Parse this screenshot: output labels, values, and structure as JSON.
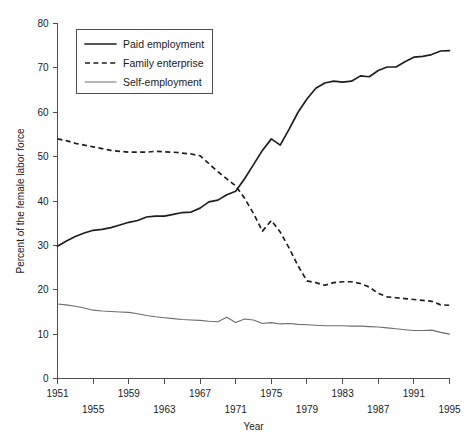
{
  "chart_data": {
    "type": "line",
    "title": "",
    "xlabel": "Year",
    "ylabel": "Percent of the female labor force",
    "xlim": [
      1951,
      1995
    ],
    "ylim": [
      0,
      80
    ],
    "ytick_values": [
      0,
      10,
      20,
      30,
      40,
      50,
      60,
      70,
      80
    ],
    "ytick_labels": [
      "0",
      "10",
      "20",
      "30",
      "40",
      "50",
      "60",
      "70",
      "80"
    ],
    "xtick_values": [
      1951,
      1955,
      1959,
      1963,
      1967,
      1971,
      1975,
      1979,
      1983,
      1987,
      1991,
      1995
    ],
    "xtick_labels": [
      "1951",
      "1955",
      "1959",
      "1963",
      "1967",
      "1971",
      "1975",
      "1979",
      "1983",
      "1987",
      "1991",
      "1995"
    ],
    "xtick_stagger": [
      0,
      1,
      0,
      1,
      0,
      1,
      0,
      1,
      0,
      1,
      0,
      1
    ],
    "grid": false,
    "legend_position": "top-left",
    "x": [
      1951,
      1952,
      1953,
      1954,
      1955,
      1956,
      1957,
      1958,
      1959,
      1960,
      1961,
      1962,
      1963,
      1964,
      1965,
      1966,
      1967,
      1968,
      1969,
      1970,
      1971,
      1972,
      1973,
      1974,
      1975,
      1976,
      1977,
      1978,
      1979,
      1980,
      1981,
      1982,
      1983,
      1984,
      1985,
      1986,
      1987,
      1988,
      1989,
      1990,
      1991,
      1992,
      1993,
      1994,
      1995
    ],
    "series": [
      {
        "name": "Paid employment",
        "style": "solid-thick",
        "color": "#1f1f1f",
        "values": [
          29.8,
          31.0,
          32.0,
          32.8,
          33.4,
          33.6,
          34.0,
          34.6,
          35.2,
          35.6,
          36.4,
          36.6,
          36.6,
          37.0,
          37.4,
          37.5,
          38.4,
          39.8,
          40.2,
          41.4,
          42.2,
          45.0,
          48.2,
          51.4,
          54.0,
          52.6,
          56.2,
          60.0,
          63.0,
          65.4,
          66.6,
          67.0,
          66.8,
          67.0,
          68.2,
          68.0,
          69.4,
          70.2,
          70.2,
          71.4,
          72.4,
          72.6,
          73.0,
          73.8,
          73.9
        ]
      },
      {
        "name": "Family enterprise",
        "style": "dashed",
        "color": "#1f1f1f",
        "values": [
          54.0,
          53.6,
          53.0,
          52.6,
          52.2,
          51.8,
          51.4,
          51.2,
          51.0,
          51.0,
          51.0,
          51.2,
          51.1,
          51.0,
          50.8,
          50.6,
          50.2,
          48.4,
          46.6,
          45.0,
          43.4,
          40.6,
          37.2,
          33.2,
          35.6,
          33.0,
          29.4,
          25.4,
          22.0,
          21.6,
          21.0,
          21.6,
          21.8,
          21.8,
          21.4,
          20.6,
          19.2,
          18.4,
          18.2,
          18.0,
          17.8,
          17.6,
          17.4,
          16.6,
          16.5
        ]
      },
      {
        "name": "Self-employment",
        "style": "solid-thin",
        "color": "#6e6e6e",
        "values": [
          16.8,
          16.6,
          16.3,
          15.9,
          15.4,
          15.2,
          15.1,
          15.0,
          14.9,
          14.6,
          14.2,
          13.9,
          13.7,
          13.5,
          13.3,
          13.2,
          13.1,
          12.9,
          12.8,
          13.8,
          12.6,
          13.4,
          13.2,
          12.4,
          12.6,
          12.3,
          12.4,
          12.2,
          12.1,
          12.0,
          11.9,
          11.9,
          11.9,
          11.8,
          11.8,
          11.7,
          11.6,
          11.4,
          11.2,
          11.0,
          10.8,
          10.8,
          10.9,
          10.4,
          10.0
        ]
      }
    ],
    "legend_entries": [
      {
        "label": "Paid employment",
        "style": "solid-thick"
      },
      {
        "label": "Family enterprise",
        "style": "dashed"
      },
      {
        "label": "Self-employment",
        "style": "solid-thin"
      }
    ]
  }
}
